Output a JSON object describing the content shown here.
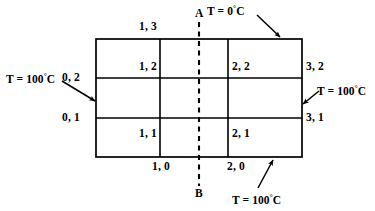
{
  "diagram": {
    "stroke_color": "#000000",
    "background_color": "#ffffff",
    "grid": {
      "columns": 3,
      "rows": 2,
      "left": 96,
      "top": 39,
      "right": 302,
      "bottom": 157,
      "vertical_lines_x": [
        160,
        228
      ],
      "horizontal_lines_y": [
        78,
        118
      ]
    },
    "centerline": {
      "top_label": "A",
      "bottom_label": "B",
      "x": 199,
      "y_top": 22,
      "y_bottom": 186,
      "style": "dashed"
    },
    "node_labels": [
      {
        "text": "1, 3",
        "x": 139,
        "y": 21
      },
      {
        "text": "1, 2",
        "x": 139,
        "y": 61
      },
      {
        "text": "2, 2",
        "x": 232,
        "y": 61
      },
      {
        "text": "3, 2",
        "x": 306,
        "y": 61
      },
      {
        "text": "0, 2",
        "x": 62,
        "y": 72
      },
      {
        "text": "0, 1",
        "x": 62,
        "y": 112
      },
      {
        "text": "3, 1",
        "x": 306,
        "y": 112
      },
      {
        "text": "1, 1",
        "x": 139,
        "y": 128
      },
      {
        "text": "2, 1",
        "x": 232,
        "y": 128
      },
      {
        "text": "1, 0",
        "x": 152,
        "y": 161
      },
      {
        "text": "2, 0",
        "x": 227,
        "y": 161
      }
    ],
    "boundary_conditions": [
      {
        "id": "top",
        "value": "0",
        "unit": "C",
        "prefix": "T = ",
        "text": "T = 0 °C",
        "label_x": 207,
        "label_y": 5,
        "arrow": {
          "x1": 257,
          "y1": 15,
          "x2": 280,
          "y2": 37
        }
      },
      {
        "id": "left",
        "value": "100",
        "unit": "C",
        "prefix": "T = ",
        "text": "T = 100 °C",
        "label_x": 6,
        "label_y": 73,
        "arrow": {
          "x1": 62,
          "y1": 81,
          "x2": 95,
          "y2": 101
        }
      },
      {
        "id": "right",
        "value": "100",
        "unit": "C",
        "prefix": "T = ",
        "text": "T = 100 °C",
        "label_x": 317,
        "label_y": 85,
        "arrow": {
          "x1": 319,
          "y1": 91,
          "x2": 302,
          "y2": 104
        }
      },
      {
        "id": "bottom",
        "value": "100",
        "unit": "C",
        "prefix": "T = ",
        "text": "T = 100 °C",
        "label_x": 232,
        "label_y": 194,
        "arrow": {
          "x1": 258,
          "y1": 188,
          "x2": 273,
          "y2": 159
        }
      }
    ]
  }
}
